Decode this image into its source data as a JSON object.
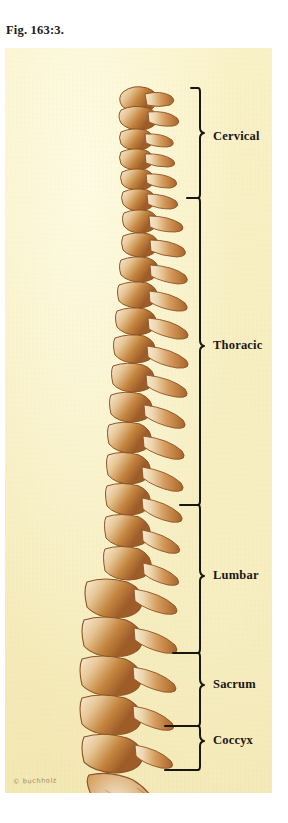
{
  "figure": {
    "caption": "Fig. 163:3.",
    "signature": "© buchholz"
  },
  "panel": {
    "background_color": "#f7eec0",
    "bone_color": "#c98a47",
    "bone_light": "#f3e0c2",
    "line_color": "#1a1713"
  },
  "regions": [
    {
      "id": "cervical",
      "label": "Cervical",
      "brace_top": 40,
      "brace_bottom": 150,
      "label_y": 88
    },
    {
      "id": "thoracic",
      "label": "Thoracic",
      "brace_top": 150,
      "brace_bottom": 457,
      "label_y": 297
    },
    {
      "id": "lumbar",
      "label": "Lumbar",
      "brace_top": 457,
      "brace_bottom": 605,
      "label_y": 527
    },
    {
      "id": "sacrum",
      "label": "Sacrum",
      "brace_top": 605,
      "brace_bottom": 678,
      "label_y": 636
    },
    {
      "id": "coccyx",
      "label": "Coccyx",
      "brace_top": 678,
      "brace_bottom": 722,
      "label_y": 692
    }
  ],
  "anatomy": {
    "title": "Vertebral column, lateral view",
    "vertebra_counts": {
      "cervical": 7,
      "thoracic": 12,
      "lumbar": 5,
      "sacrum": 5,
      "coccyx": 4
    }
  }
}
